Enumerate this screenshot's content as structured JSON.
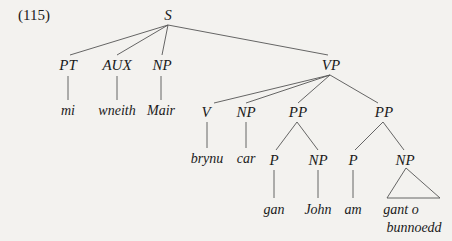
{
  "example_number": "(115)",
  "tree": {
    "S": "S",
    "PT": "PT",
    "AUX": "AUX",
    "NP_subj": "NP",
    "VP": "VP",
    "V": "V",
    "NP_obj": "NP",
    "PP1": "PP",
    "PP2": "PP",
    "P1": "P",
    "NP_pp1": "NP",
    "P2": "P",
    "NP_pp2": "NP"
  },
  "words": {
    "mi": "mi",
    "wneith": "wneith",
    "Mair": "Mair",
    "brynu": "brynu",
    "car": "car",
    "gan": "gan",
    "John": "John",
    "am": "am",
    "gant_o": "gant o",
    "bunnoedd": "bunnoedd"
  },
  "colors": {
    "background": "#f3f2ef",
    "ink": "#1a1a1a",
    "line": "#555555"
  }
}
